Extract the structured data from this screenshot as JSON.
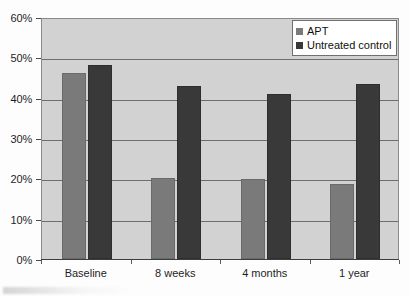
{
  "chart_data": {
    "type": "bar",
    "title": "",
    "subtitle": "",
    "xlabel": "",
    "ylabel": "",
    "categories": [
      "Baseline",
      "8 weeks",
      "4 months",
      "1 year"
    ],
    "series": [
      {
        "name": "APT",
        "color": "#7a7a7a",
        "values": [
          46.0,
          20.0,
          19.8,
          18.7
        ]
      },
      {
        "name": "Untreated control",
        "color": "#393939",
        "values": [
          48.0,
          42.8,
          40.8,
          43.5
        ]
      }
    ],
    "ylim": [
      0,
      60
    ],
    "y_tick_values": [
      0,
      10,
      20,
      30,
      40,
      50,
      60
    ],
    "y_tick_labels": [
      "0%",
      "10%",
      "20%",
      "30%",
      "40%",
      "50%",
      "60%"
    ],
    "grid": "horizontal",
    "legend_position": "top-right",
    "plot_background": "#d2d2d2",
    "grid_color": "#6e6e6e"
  },
  "legend": {
    "items": [
      {
        "label": "APT",
        "swatch": "apt"
      },
      {
        "label": "Untreated control",
        "swatch": "ctrl"
      }
    ]
  }
}
